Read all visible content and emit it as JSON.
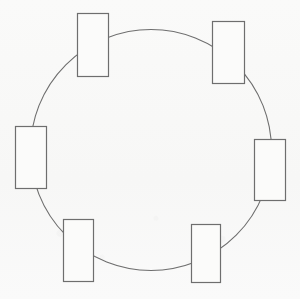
{
  "figure": {
    "type": "diagram",
    "canvas": {
      "width": 300,
      "height": 299,
      "background": "#f9f9f8"
    },
    "stroke": {
      "color": "#6e6e6e",
      "width": 1
    },
    "node_fill": "none",
    "circle": {
      "label": "ring-path",
      "cx": 151,
      "cy": 150,
      "r": 120.5
    },
    "nodes": [
      {
        "name": "node-top-left",
        "label": "",
        "x": 77,
        "y": 13,
        "w": 32,
        "h": 64,
        "angle_deg": 120
      },
      {
        "name": "node-top-right",
        "label": "",
        "x": 212,
        "y": 21,
        "w": 33,
        "h": 63,
        "angle_deg": 60
      },
      {
        "name": "node-left",
        "label": "",
        "x": 15,
        "y": 126,
        "w": 32,
        "h": 63,
        "angle_deg": 180
      },
      {
        "name": "node-right",
        "label": "",
        "x": 254,
        "y": 139,
        "w": 32,
        "h": 62,
        "angle_deg": 0
      },
      {
        "name": "node-bottom-left",
        "label": "",
        "x": 63,
        "y": 219,
        "w": 31,
        "h": 63,
        "angle_deg": 240
      },
      {
        "name": "node-bottom-right",
        "label": "",
        "x": 191,
        "y": 224,
        "w": 30,
        "h": 59,
        "angle_deg": 300
      }
    ]
  }
}
